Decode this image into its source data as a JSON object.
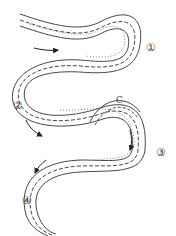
{
  "diagram": {
    "type": "meandering-river",
    "labels": {
      "l1": "①",
      "l2": "②",
      "l3": "③",
      "l4": "④",
      "c": "C"
    },
    "colors": {
      "line": "#333333",
      "background": "#ffffff"
    }
  }
}
